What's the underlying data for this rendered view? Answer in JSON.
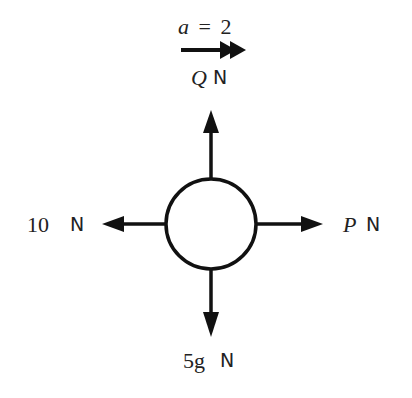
{
  "diagram": {
    "type": "force-diagram",
    "acceleration": {
      "symbol": "a",
      "equals": "=",
      "value": "2",
      "direction": "right"
    },
    "body": {
      "shape": "circle"
    },
    "forces": [
      {
        "id": "up",
        "symbol": "Q",
        "unit": "N",
        "direction": "up"
      },
      {
        "id": "right",
        "symbol": "P",
        "unit": "N",
        "direction": "right"
      },
      {
        "id": "left",
        "symbol": "10",
        "unit": "N",
        "direction": "left"
      },
      {
        "id": "down",
        "symbol": "5g",
        "unit": "N",
        "direction": "down"
      }
    ],
    "colors": {
      "stroke": "#111111",
      "background": "#ffffff"
    }
  }
}
